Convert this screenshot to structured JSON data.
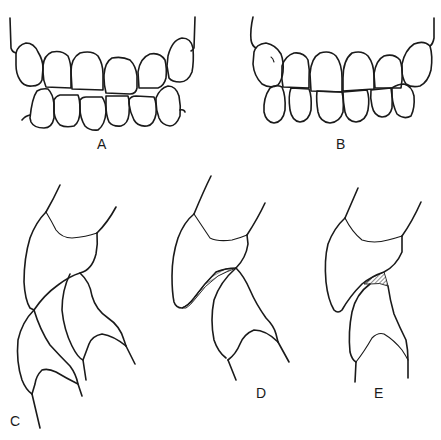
{
  "figure": {
    "panels": [
      {
        "id": "A",
        "label": "A",
        "content": "frontal view of upper and lower anterior teeth, end-to-end/edge occlusion with upper and lower rows meeting along a flat line"
      },
      {
        "id": "B",
        "label": "B",
        "content": "frontal view of upper and lower anterior teeth in normal occlusion, upper incisors overlapping lower"
      },
      {
        "id": "C",
        "label": "C",
        "content": "lateral profile of incisors in normal overbite/overjet relation"
      },
      {
        "id": "D",
        "label": "D",
        "content": "lateral profile showing deep bite with hatched wear area on palatal surface of upper incisor"
      },
      {
        "id": "E",
        "label": "E",
        "content": "lateral profile showing edge-to-edge contact with small hatched wear area at incisal edges"
      }
    ],
    "stroke_color": "#1a1a1a",
    "background_color": "#ffffff"
  }
}
